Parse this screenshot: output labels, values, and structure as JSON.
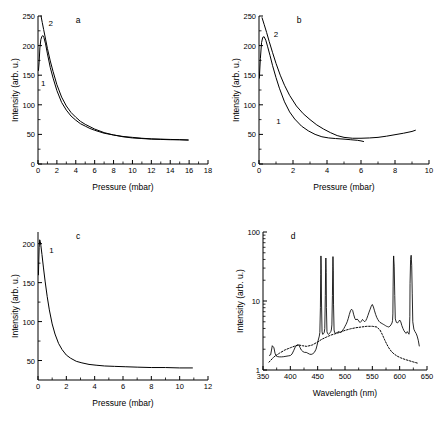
{
  "figure": {
    "panels": [
      "a",
      "b",
      "c",
      "d"
    ]
  },
  "chart_data": [
    {
      "type": "line",
      "panel": "a",
      "title": "a",
      "xlabel": "Pressure (mbar)",
      "ylabel": "Intensity (arb. u.)",
      "xlim": [
        0,
        18
      ],
      "ylim": [
        0,
        250
      ],
      "xticks": [
        0,
        2,
        4,
        6,
        8,
        10,
        12,
        14,
        16,
        18
      ],
      "yticks": [
        0,
        50,
        100,
        150,
        200,
        250
      ],
      "grid": false,
      "legend": "inline-curve-labels",
      "series": [
        {
          "name": "1",
          "label_x": 0.55,
          "label_y": 131,
          "x": [
            0.05,
            0.12,
            0.2,
            0.3,
            0.4,
            0.5,
            0.62,
            0.8,
            1.0,
            1.3,
            1.6,
            2.0,
            2.5,
            3.0,
            3.5,
            4.0,
            4.5,
            5.0,
            5.5,
            6.0,
            7.0,
            8.0,
            9.0,
            10.0,
            11.0,
            12.0,
            13.0,
            14.0,
            15.0,
            15.9
          ],
          "y": [
            158,
            172,
            196,
            210,
            215,
            217,
            214,
            203,
            186,
            163,
            145,
            124,
            104,
            91,
            81,
            74,
            68,
            64,
            60,
            57,
            52,
            49,
            46,
            44,
            43,
            42,
            41.5,
            41,
            41,
            40.5
          ]
        },
        {
          "name": "2",
          "label_x": 1.35,
          "label_y": 233,
          "x": [
            0.32,
            0.45,
            0.6,
            0.8,
            1.0,
            1.3,
            1.6,
            2.0,
            2.5,
            3.0,
            3.5,
            4.0,
            4.5,
            5.0,
            5.5,
            6.0,
            7.0,
            8.0,
            9.0,
            10.0,
            11.0,
            12.0,
            13.0,
            14.0,
            15.0,
            15.9
          ],
          "y": [
            250,
            239,
            227,
            211,
            195,
            174,
            156,
            134,
            113,
            98,
            87,
            79,
            72,
            67,
            63,
            59,
            53,
            49,
            46.5,
            45,
            43.5,
            42.5,
            42,
            41.5,
            41,
            40.5
          ]
        }
      ]
    },
    {
      "type": "line",
      "panel": "b",
      "title": "b",
      "xlabel": "Pressure (mbar)",
      "ylabel": "Intensity (arb. u.)",
      "xlim": [
        0,
        10
      ],
      "ylim": [
        0,
        250
      ],
      "xticks": [
        0,
        2,
        4,
        6,
        8,
        10
      ],
      "yticks": [
        0,
        50,
        100,
        150,
        200,
        250
      ],
      "grid": false,
      "legend": "inline-curve-labels",
      "series": [
        {
          "name": "1",
          "label_x": 1.15,
          "label_y": 68,
          "x": [
            0.02,
            0.08,
            0.15,
            0.22,
            0.3,
            0.4,
            0.5,
            0.65,
            0.8,
            1.0,
            1.2,
            1.5,
            1.8,
            2.1,
            2.5,
            2.9,
            3.3,
            3.7,
            4.1,
            4.5,
            5.0,
            5.4,
            5.8,
            6.0,
            6.15
          ],
          "y": [
            145,
            178,
            205,
            214,
            215,
            209,
            199,
            183,
            166,
            146,
            128,
            105,
            88,
            76,
            64,
            56,
            50,
            46,
            44,
            43,
            42,
            41,
            40,
            39,
            38
          ]
        },
        {
          "name": "2",
          "label_x": 1.0,
          "label_y": 215,
          "x": [
            0.18,
            0.3,
            0.45,
            0.6,
            0.8,
            1.0,
            1.25,
            1.5,
            1.8,
            2.2,
            2.6,
            3.0,
            3.4,
            3.8,
            4.2,
            4.6,
            5.0,
            5.5,
            6.0,
            6.5,
            7.0,
            7.5,
            8.0,
            8.5,
            9.0,
            9.2
          ],
          "y": [
            247,
            236,
            222,
            207,
            188,
            170,
            150,
            133,
            116,
            98,
            85,
            75,
            66,
            59,
            53,
            48,
            45,
            43.5,
            43.5,
            44,
            45,
            47,
            49.5,
            52,
            55,
            57
          ]
        }
      ]
    },
    {
      "type": "line",
      "panel": "c",
      "title": "c",
      "xlabel": "Pressure (mbar)",
      "ylabel": "Intensity (arb. u.)",
      "xlim": [
        0,
        12
      ],
      "ylim": [
        25,
        215
      ],
      "xticks": [
        0,
        2,
        4,
        6,
        8,
        10,
        12
      ],
      "yticks": [
        50,
        100,
        150,
        200
      ],
      "grid": false,
      "legend": "inline-curve-labels",
      "series": [
        {
          "name": "1",
          "label_x": 0.95,
          "label_y": 188,
          "x": [
            0.03,
            0.08,
            0.12,
            0.16,
            0.2,
            0.28,
            0.38,
            0.5,
            0.65,
            0.8,
            1.0,
            1.2,
            1.45,
            1.7,
            2.0,
            2.3,
            2.7,
            3.1,
            3.6,
            4.1,
            4.7,
            5.4,
            6.2,
            7.0,
            8.0,
            9.0,
            10.0,
            10.9
          ],
          "y": [
            160,
            195,
            205,
            203,
            198,
            186,
            170,
            152,
            132,
            115,
            97,
            84,
            72,
            64,
            57,
            53,
            49,
            47,
            45,
            44,
            43,
            42.5,
            42,
            41.5,
            41,
            41,
            40.5,
            40.5
          ]
        }
      ]
    },
    {
      "type": "line",
      "panel": "d",
      "title": "d",
      "xlabel": "Wavelength (nm)",
      "ylabel": "Intensity (arb. u.)",
      "xlim": [
        350,
        650
      ],
      "ylim": [
        1,
        100
      ],
      "yscale": "log",
      "xticks": [
        350,
        400,
        450,
        500,
        550,
        600,
        650
      ],
      "yticks": [
        1,
        10,
        100
      ],
      "ytick_labels": [
        "1",
        "10",
        "100"
      ],
      "grid": false,
      "legend": "none",
      "series": [
        {
          "name": "spectrum",
          "style": "solid",
          "x": [
            361,
            364,
            367,
            370,
            372,
            374,
            377,
            380,
            384,
            388,
            392,
            396,
            400,
            403,
            406,
            409,
            412,
            414,
            416,
            418,
            420,
            423,
            426,
            429,
            432,
            435,
            438,
            441,
            444,
            447,
            449,
            451,
            453,
            454,
            455,
            455.6,
            456,
            456.5,
            457,
            458,
            459,
            460,
            461,
            462,
            463,
            464,
            464.6,
            465,
            465.6,
            466,
            467,
            468,
            469,
            470,
            471,
            472,
            473,
            474,
            475,
            476,
            477,
            477.6,
            478,
            478.6,
            479,
            480,
            481,
            482,
            484,
            486,
            488,
            490,
            492,
            494,
            496,
            498,
            500,
            502,
            504,
            506,
            508,
            510,
            512,
            514,
            516,
            518,
            520,
            522,
            524,
            526,
            528,
            530,
            532,
            534,
            536,
            538,
            540,
            542,
            544,
            546,
            548,
            550,
            552,
            554,
            556,
            558,
            560,
            562,
            564,
            566,
            568,
            570,
            572,
            574,
            576,
            578,
            580,
            582,
            584,
            586,
            587,
            587.6,
            588,
            588.6,
            589,
            590,
            591,
            592,
            594,
            596,
            598,
            600,
            602,
            604,
            606,
            608,
            610,
            612,
            614,
            616,
            617,
            617.6,
            618,
            618.6,
            619,
            620,
            621,
            622,
            623,
            624,
            626,
            628,
            630,
            632,
            634,
            636
          ],
          "y": [
            1.62,
            1.66,
            2.25,
            2.1,
            1.75,
            1.6,
            1.56,
            1.55,
            1.55,
            1.56,
            1.58,
            1.6,
            1.62,
            1.7,
            1.9,
            2.15,
            2.3,
            2.32,
            2.28,
            2.1,
            1.95,
            1.85,
            1.8,
            1.8,
            1.75,
            1.7,
            1.68,
            1.72,
            1.8,
            2.0,
            2.3,
            2.7,
            3.1,
            3.5,
            8,
            24,
            45,
            30,
            10,
            3.6,
            3.3,
            3.3,
            3.4,
            3.5,
            4.0,
            12,
            30,
            42,
            26,
            8,
            3.6,
            3.4,
            3.3,
            3.3,
            3.35,
            3.4,
            3.5,
            3.6,
            3.8,
            4.5,
            12,
            32,
            44,
            28,
            9,
            3.8,
            3.5,
            3.4,
            3.45,
            3.5,
            3.6,
            3.55,
            3.5,
            3.6,
            3.8,
            4.0,
            4.3,
            4.6,
            5.0,
            5.6,
            6.4,
            7.2,
            7.6,
            7.3,
            6.3,
            5.6,
            5.3,
            5.5,
            5.3,
            5.0,
            4.9,
            5.1,
            5.4,
            5.2,
            5.0,
            5.2,
            5.6,
            6.2,
            6.9,
            7.6,
            8.4,
            8.9,
            8.2,
            7.2,
            6.4,
            5.8,
            5.4,
            5.1,
            4.9,
            4.8,
            4.7,
            4.6,
            4.5,
            4.4,
            4.3,
            4.25,
            4.2,
            4.3,
            4.5,
            4.8,
            5.2,
            6.5,
            16,
            38,
            45,
            32,
            12,
            5.5,
            4.9,
            4.8,
            5.0,
            5.3,
            5.0,
            4.4,
            4.0,
            3.7,
            3.5,
            3.4,
            3.6,
            3.4,
            3.3,
            3.5,
            4.2,
            6.0,
            18,
            40,
            46,
            33,
            13,
            5.0,
            3.9,
            3.6,
            3.4,
            3.1,
            2.7,
            2.2,
            1.7,
            1.35,
            1.3
          ]
        },
        {
          "name": "baseline",
          "style": "dotted",
          "x": [
            361,
            370,
            380,
            390,
            400,
            410,
            416,
            422,
            430,
            440,
            450,
            458,
            466,
            474,
            482,
            490,
            500,
            510,
            520,
            530,
            540,
            550,
            558,
            564,
            568,
            572,
            576,
            580,
            585,
            590,
            596,
            602,
            610,
            618,
            626,
            634
          ],
          "y": [
            1.3,
            1.55,
            1.75,
            1.95,
            2.1,
            2.25,
            2.3,
            2.25,
            2.2,
            2.3,
            2.55,
            2.8,
            3.0,
            3.2,
            3.35,
            3.5,
            3.75,
            3.95,
            4.1,
            4.2,
            4.3,
            4.3,
            4.2,
            3.8,
            3.3,
            2.8,
            2.4,
            2.1,
            1.85,
            1.7,
            1.58,
            1.5,
            1.42,
            1.36,
            1.3,
            1.25
          ]
        }
      ]
    }
  ]
}
